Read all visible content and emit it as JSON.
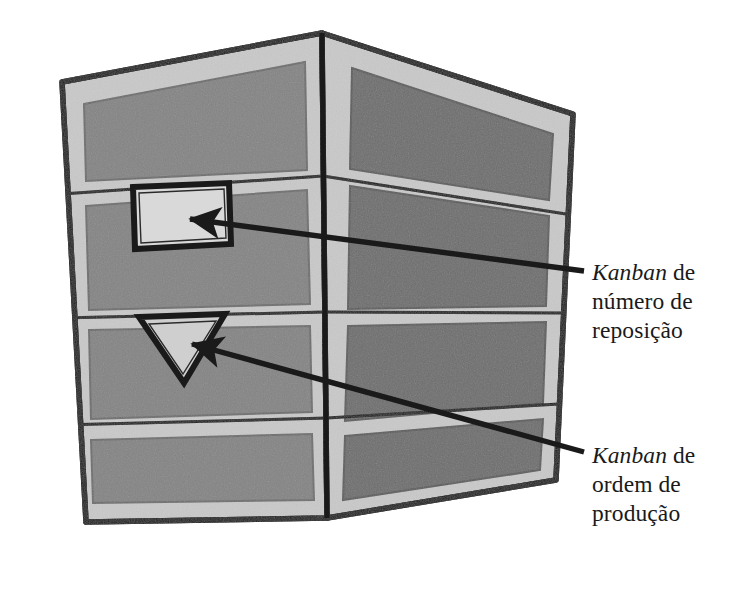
{
  "figure": {
    "kind": "technical-illustration",
    "background_color": "#ffffff"
  },
  "palette": {
    "outline": "#1a1a1a",
    "frame_light": "#c9c9c9",
    "frame_light_edge": "#b6b6b6",
    "panel_left": "#848484",
    "panel_right": "#6e6e6e",
    "card_fill": "#d9d9d9",
    "triangle_fill": "#cfcfcf",
    "text": "#1a1a1a"
  },
  "rack": {
    "faces": [
      {
        "name": "left-face",
        "rows": 4,
        "panel_color": "#848484"
      },
      {
        "name": "right-face",
        "rows": 4,
        "panel_color": "#6e6e6e"
      }
    ],
    "total_rows": 4
  },
  "kanban_cards": [
    {
      "id": "rectangular-card",
      "shape": "rectangle",
      "fill": "#d9d9d9",
      "row": 2,
      "face": "left-face",
      "label_ref": "label-reposicao"
    },
    {
      "id": "triangular-card",
      "shape": "triangle-down",
      "fill": "#cfcfcf",
      "row": 3,
      "face": "left-face",
      "label_ref": "label-producao"
    }
  ],
  "labels": [
    {
      "id": "label-reposicao",
      "emphasis_word": "Kanban",
      "line1_rest": " de",
      "line2": "número de",
      "line3": "reposição",
      "full_text": "Kanban de número de reposição"
    },
    {
      "id": "label-producao",
      "emphasis_word": "Kanban",
      "line1_rest": " de",
      "line2": "ordem de",
      "line3": "produção",
      "full_text": "Kanban de ordem de produção"
    }
  ],
  "annotations": {
    "arrows": [
      {
        "id": "arrow-to-rect-card",
        "from": "label-reposicao",
        "to": "rectangular-card",
        "direction": "right-to-left"
      },
      {
        "id": "arrow-to-triangle-card",
        "from": "label-producao",
        "to": "triangular-card",
        "direction": "lower-right-to-upper-left"
      }
    ]
  }
}
